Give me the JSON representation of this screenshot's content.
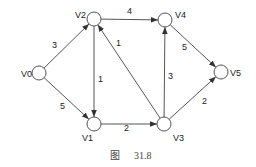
{
  "diagram": {
    "type": "weighted-directed-graph",
    "caption": {
      "prefix": "图",
      "number": "31.8"
    },
    "node_radius": 7,
    "nodes": [
      {
        "id": "V0",
        "label": "V0",
        "x": 39,
        "y": 73,
        "lx": 21,
        "ly": 77
      },
      {
        "id": "V1",
        "label": "V1",
        "x": 94,
        "y": 124,
        "lx": 82,
        "ly": 141
      },
      {
        "id": "V2",
        "label": "V2",
        "x": 94,
        "y": 19,
        "lx": 75,
        "ly": 18
      },
      {
        "id": "V3",
        "label": "V3",
        "x": 164,
        "y": 124,
        "lx": 173,
        "ly": 141
      },
      {
        "id": "V4",
        "label": "V4",
        "x": 165,
        "y": 20,
        "lx": 175,
        "ly": 18
      },
      {
        "id": "V5",
        "label": "V5",
        "x": 221,
        "y": 72,
        "lx": 230,
        "ly": 76
      }
    ],
    "edges": [
      {
        "from": "V0",
        "to": "V2",
        "weight": "3",
        "wx": 52,
        "wy": 48
      },
      {
        "from": "V0",
        "to": "V1",
        "weight": "5",
        "wx": 60,
        "wy": 109
      },
      {
        "from": "V2",
        "to": "V4",
        "weight": "4",
        "wx": 127,
        "wy": 14
      },
      {
        "from": "V2",
        "to": "V1",
        "weight": "1",
        "wx": 98,
        "wy": 82
      },
      {
        "from": "V1",
        "to": "V3",
        "weight": "2",
        "wx": 124,
        "wy": 131
      },
      {
        "from": "V3",
        "to": "V2",
        "weight": "1",
        "wx": 116,
        "wy": 46
      },
      {
        "from": "V3",
        "to": "V4",
        "weight": "3",
        "wx": 168,
        "wy": 79
      },
      {
        "from": "V4",
        "to": "V5",
        "weight": "5",
        "wx": 182,
        "wy": 50
      },
      {
        "from": "V3",
        "to": "V5",
        "weight": "2",
        "wx": 202,
        "wy": 104
      }
    ]
  }
}
